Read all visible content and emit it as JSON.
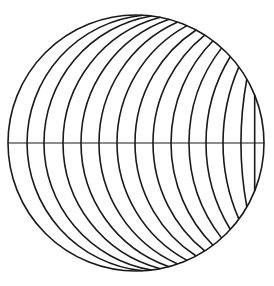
{
  "diagram": {
    "title": "",
    "type": "circle-with-arcs",
    "stroke_color": "#1a1a1a",
    "background": "#ffffff",
    "outer_circle": {
      "cx": 136,
      "cy": 143,
      "r": 128
    },
    "equator": {
      "x1": 8,
      "x2": 264,
      "y": 143
    },
    "arcs": [
      {
        "x_eq": 27,
        "theta_deg": 3
      },
      {
        "x_eq": 44,
        "theta_deg": 7
      },
      {
        "x_eq": 63,
        "theta_deg": 11
      },
      {
        "x_eq": 81,
        "theta_deg": 15
      },
      {
        "x_eq": 99,
        "theta_deg": 19
      },
      {
        "x_eq": 117,
        "theta_deg": 23.5
      },
      {
        "x_eq": 135,
        "theta_deg": 28
      },
      {
        "x_eq": 153,
        "theta_deg": 32.5
      },
      {
        "x_eq": 171,
        "theta_deg": 37
      },
      {
        "x_eq": 189,
        "theta_deg": 42
      },
      {
        "x_eq": 206,
        "theta_deg": 47.5
      },
      {
        "x_eq": 223,
        "theta_deg": 53.5
      },
      {
        "x_eq": 241,
        "theta_deg": 60
      },
      {
        "x_eq": 255,
        "theta_deg": 68
      }
    ]
  }
}
